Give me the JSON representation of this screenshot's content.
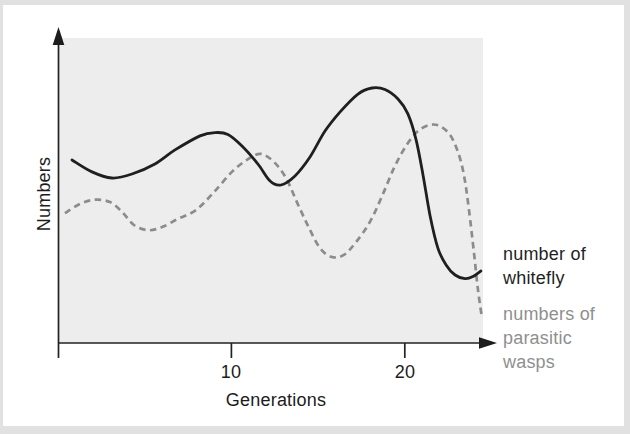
{
  "figure": {
    "ylabel": "Numbers",
    "xlabel": "Generations",
    "xticks": [
      "10",
      "20"
    ],
    "legend": [
      {
        "label": "number of whitefly",
        "color": "#1f1f1f"
      },
      {
        "label": "numbers of parasitic wasps",
        "color": "#8f8f8f"
      }
    ]
  },
  "colors": {
    "page_background": "#e1e1e1",
    "paper": "#ffffff",
    "plot_background": "#ededed",
    "axis": "#222222"
  },
  "chart_data": {
    "type": "line",
    "title": "",
    "xlabel": "Generations",
    "ylabel": "Numbers",
    "xlim": [
      0,
      25
    ],
    "ylim": [
      0,
      100
    ],
    "xticks": [
      10,
      20
    ],
    "yticks": [],
    "grid": false,
    "legend_position": "right-outside",
    "note": "Qualitative sketch: y-axis has no numeric scale; values are relative numbers 0-100",
    "series": [
      {
        "name": "number of whitefly",
        "style": "solid",
        "color": "#1f1f1f",
        "points": [
          [
            0.81,
            60.0
          ],
          [
            1.96,
            56.1
          ],
          [
            3.11,
            54.1
          ],
          [
            4.27,
            55.4
          ],
          [
            5.59,
            58.7
          ],
          [
            6.75,
            63.3
          ],
          [
            8.19,
            67.9
          ],
          [
            9.05,
            69.0
          ],
          [
            9.8,
            68.4
          ],
          [
            10.61,
            64.6
          ],
          [
            11.53,
            58.7
          ],
          [
            12.23,
            53.1
          ],
          [
            12.86,
            51.8
          ],
          [
            13.67,
            54.8
          ],
          [
            14.53,
            61.0
          ],
          [
            15.4,
            69.5
          ],
          [
            16.26,
            75.7
          ],
          [
            17.3,
            81.6
          ],
          [
            18.11,
            83.6
          ],
          [
            18.86,
            83.1
          ],
          [
            19.61,
            80.0
          ],
          [
            20.18,
            75.1
          ],
          [
            20.65,
            66.6
          ],
          [
            21.05,
            55.1
          ],
          [
            21.45,
            42.0
          ],
          [
            21.91,
            31.1
          ],
          [
            22.38,
            25.6
          ],
          [
            22.9,
            22.3
          ],
          [
            23.47,
            21.1
          ],
          [
            23.93,
            21.8
          ],
          [
            24.39,
            23.6
          ]
        ]
      },
      {
        "name": "numbers of parasitic wasps",
        "style": "dashed",
        "color": "#8c8c8c",
        "points": [
          [
            0.4,
            42.6
          ],
          [
            1.27,
            45.6
          ],
          [
            2.13,
            47.0
          ],
          [
            3.0,
            46.2
          ],
          [
            3.69,
            43.0
          ],
          [
            4.38,
            38.7
          ],
          [
            5.19,
            37.0
          ],
          [
            6.0,
            38.0
          ],
          [
            6.92,
            40.7
          ],
          [
            7.96,
            43.6
          ],
          [
            9.0,
            49.5
          ],
          [
            10.03,
            56.1
          ],
          [
            10.96,
            60.3
          ],
          [
            11.71,
            62.0
          ],
          [
            12.46,
            59.3
          ],
          [
            13.15,
            54.1
          ],
          [
            13.78,
            46.2
          ],
          [
            14.42,
            38.4
          ],
          [
            15.11,
            31.1
          ],
          [
            15.8,
            28.2
          ],
          [
            16.49,
            28.9
          ],
          [
            17.19,
            33.1
          ],
          [
            17.99,
            39.7
          ],
          [
            18.69,
            48.2
          ],
          [
            19.38,
            57.4
          ],
          [
            20.07,
            64.6
          ],
          [
            20.76,
            69.5
          ],
          [
            21.45,
            71.5
          ],
          [
            22.03,
            71.1
          ],
          [
            22.61,
            68.2
          ],
          [
            23.07,
            62.6
          ],
          [
            23.41,
            55.1
          ],
          [
            23.7,
            43.6
          ],
          [
            23.99,
            29.5
          ],
          [
            24.22,
            17.4
          ],
          [
            24.45,
            8.2
          ]
        ]
      }
    ]
  }
}
